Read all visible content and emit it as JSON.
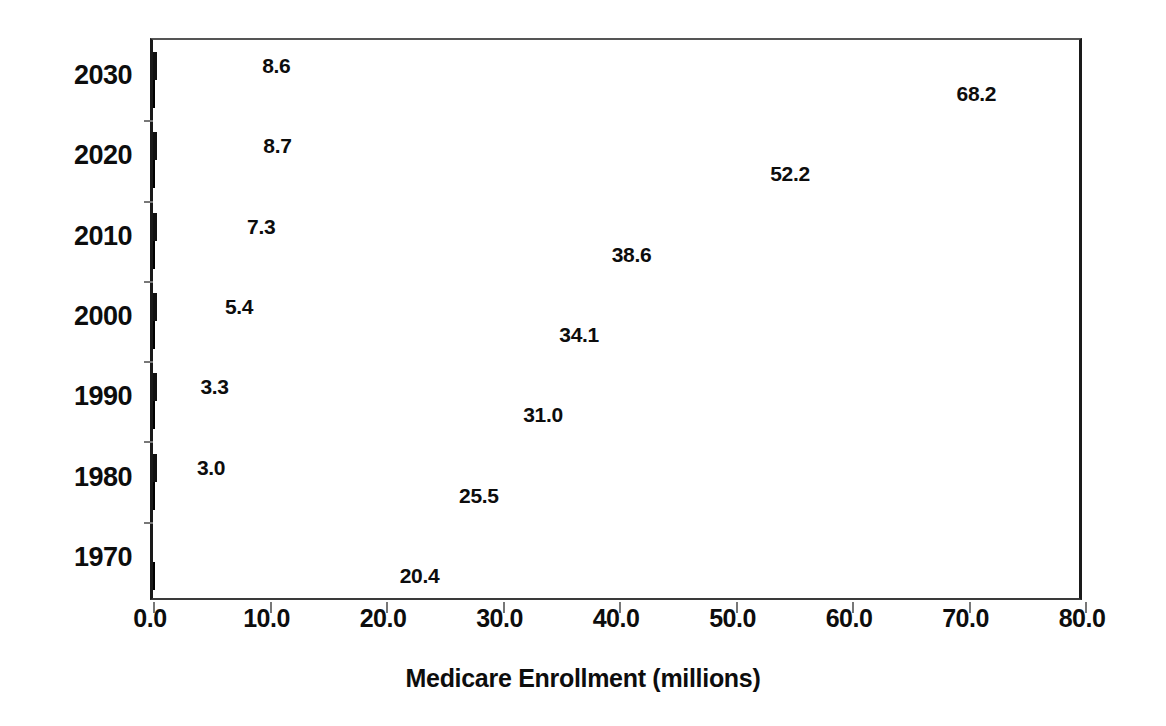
{
  "chart_data": {
    "type": "bar",
    "orientation": "horizontal",
    "title": "",
    "xlabel": "Medicare Enrollment (millions)",
    "ylabel": "",
    "xlim": [
      0.0,
      80.0
    ],
    "xticks": [
      "0.0",
      "10.0",
      "20.0",
      "30.0",
      "40.0",
      "50.0",
      "60.0",
      "70.0",
      "80.0"
    ],
    "xtick_values": [
      0,
      10,
      20,
      30,
      40,
      50,
      60,
      70,
      80
    ],
    "grid": false,
    "legend": "none",
    "categories": [
      "2030",
      "2020",
      "2010",
      "2000",
      "1990",
      "1980",
      "1970"
    ],
    "series": [
      {
        "name": "white-outlined-series",
        "style": "white-fill-black-outline",
        "values": [
          8.6,
          8.7,
          7.3,
          5.4,
          3.3,
          3.0,
          null
        ],
        "labels": [
          "8.6",
          "8.7",
          "7.3",
          "5.4",
          "3.3",
          "3.0",
          ""
        ]
      },
      {
        "name": "black-filled-series",
        "style": "black-fill",
        "values": [
          68.2,
          52.2,
          38.6,
          34.1,
          31.0,
          25.5,
          20.4
        ],
        "labels": [
          "68.2",
          "52.2",
          "38.6",
          "34.1",
          "31.0",
          "25.5",
          "20.4"
        ]
      }
    ],
    "colors": {
      "light_bar_fill": "#ffffff",
      "light_bar_border": "#111111",
      "dark_bar_fill": "#1c1c1c",
      "axis": "#1a1a1a",
      "text": "#0d0d0d"
    }
  }
}
